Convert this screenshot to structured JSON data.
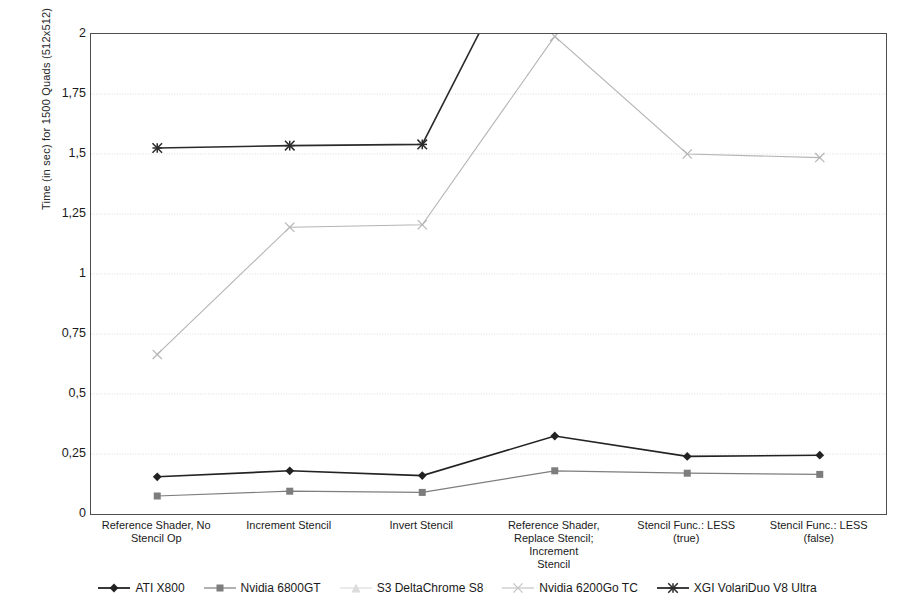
{
  "chart_data": {
    "type": "line",
    "title": "",
    "subtitle": "",
    "xlabel": "",
    "ylabel": "Time (in sec) for 1500 Quads (512x512)",
    "ylim": [
      0,
      2
    ],
    "yticks": [
      "0",
      "0,25",
      "0,5",
      "0,75",
      "1",
      "1,25",
      "1,5",
      "1,75",
      "2"
    ],
    "ytick_values": [
      0,
      0.25,
      0.5,
      0.75,
      1,
      1.25,
      1.5,
      1.75,
      2
    ],
    "grid": true,
    "legend_position": "bottom",
    "decimal_separator": ",",
    "categories": [
      "Reference Shader, No Stencil Op",
      "Increment Stencil",
      "Invert Stencil",
      "Reference Shader, Replace Stencil; Increment Stencil",
      "Stencil Func.: LESS (true)",
      "Stencil Func.: LESS (false)"
    ],
    "category_lines": [
      [
        "Reference Shader, No",
        "Stencil Op"
      ],
      [
        "Increment Stencil"
      ],
      [
        "Invert Stencil"
      ],
      [
        "Reference Shader,",
        "Replace Stencil; Increment",
        "Stencil"
      ],
      [
        "Stencil Func.: LESS (true)"
      ],
      [
        "Stencil Func.: LESS (false)"
      ]
    ],
    "series": [
      {
        "name": "ATI X800",
        "marker": "diamond",
        "color": "#222222",
        "line_width": 1.6,
        "values": [
          0.155,
          0.18,
          0.16,
          0.325,
          0.24,
          0.245
        ]
      },
      {
        "name": "Nvidia 6800GT",
        "marker": "square",
        "color": "#7d7d7d",
        "line_width": 1.2,
        "values": [
          0.075,
          0.095,
          0.09,
          0.18,
          0.17,
          0.165
        ]
      },
      {
        "name": "S3 DeltaChrome S8",
        "marker": "triangle",
        "color": "#d9d9d9",
        "line_width": 1.0,
        "values": [
          null,
          null,
          null,
          null,
          null,
          null
        ]
      },
      {
        "name": "Nvidia 6200Go TC",
        "marker": "x",
        "color": "#b4b4b4",
        "line_width": 1.1,
        "values": [
          0.665,
          1.195,
          1.205,
          1.99,
          1.5,
          1.485
        ]
      },
      {
        "name": "XGI VolariDuo V8 Ultra",
        "marker": "asterisk",
        "color": "#2b2b2b",
        "line_width": 1.6,
        "values": [
          1.525,
          1.535,
          1.54,
          2.62,
          null,
          null
        ],
        "clipped_above_axis": true
      }
    ]
  },
  "legend": {
    "items": [
      {
        "label": "ATI X800",
        "marker": "diamond",
        "color": "#222222"
      },
      {
        "label": "Nvidia 6800GT",
        "marker": "square",
        "color": "#7d7d7d"
      },
      {
        "label": "S3 DeltaChrome S8",
        "marker": "triangle",
        "color": "#dcdcdc"
      },
      {
        "label": "Nvidia 6200Go TC",
        "marker": "x",
        "color": "#c4c4c4"
      },
      {
        "label": "XGI VolariDuo V8 Ultra",
        "marker": "asterisk",
        "color": "#2b2b2b"
      }
    ]
  }
}
